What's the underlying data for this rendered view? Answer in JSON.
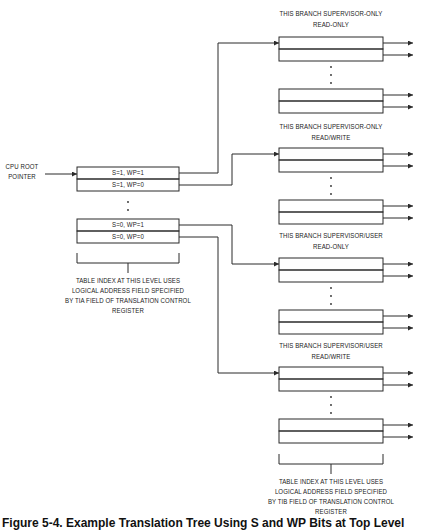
{
  "root": {
    "label_line1": "CPU ROOT",
    "label_line2": "POINTER",
    "entries": [
      "S=1, WP=1",
      "S=1, WP=0",
      "S=0, WP=1",
      "S=0, WP=0"
    ],
    "note_lines": [
      "TABLE INDEX AT THIS LEVEL USES",
      "LOGICAL ADDRESS FIELD SPECIFIED",
      "BY TIA FIELD OF TRANSLATION CONTROL",
      "REGISTER"
    ]
  },
  "branches": [
    {
      "title_line1": "THIS BRANCH SUPERVISOR-ONLY",
      "title_line2": "READ-ONLY"
    },
    {
      "title_line1": "THIS BRANCH SUPERVISOR-ONLY",
      "title_line2": "READ/WRITE"
    },
    {
      "title_line1": "THIS BRANCH SUPERVISOR/USER",
      "title_line2": "READ-ONLY"
    },
    {
      "title_line1": "THIS BRANCH SUPERVISOR/USER",
      "title_line2": "READ/WRITE"
    }
  ],
  "second_level_note_lines": [
    "TABLE INDEX AT THIS LEVEL USES",
    "LOGICAL ADDRESS FIELD SPECIFIED",
    "BY TIB FIELD OF TRANSLATION CONTROL",
    "REGISTER"
  ],
  "caption": "Figure 5-4. Example Translation Tree Using S and WP Bits at Top Level",
  "colors": {
    "line": "#2a2a2a",
    "background": "#ffffff"
  }
}
